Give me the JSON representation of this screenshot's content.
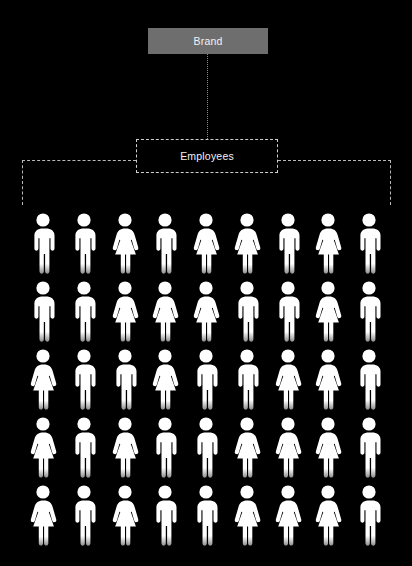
{
  "canvas": {
    "width": 412,
    "height": 566,
    "background_color": "#000000"
  },
  "diagram": {
    "type": "organization-pictogram",
    "nodes": {
      "brand": {
        "label": "Brand",
        "fill_color": "#6e6e6e",
        "text_color": "#f2f2f2",
        "border_style": "none"
      },
      "employees": {
        "label": "Employees",
        "fill_color": "transparent",
        "text_color": "#f2f2f2",
        "border_style": "dashed",
        "border_color": "#cfcfcf"
      }
    },
    "connectors": {
      "brand_to_employees": {
        "style": "dotted",
        "color": "#8a8a8a",
        "orientation": "vertical"
      },
      "employees_bracket": {
        "style": "dashed",
        "color": "#b9b9b9",
        "shape": "horizontal-span-with-end-drops"
      }
    }
  },
  "pictogram": {
    "icon_color": "#ffffff",
    "columns": 9,
    "rows": 5,
    "total_figures": 45,
    "male_count": 22,
    "female_count": 23,
    "legend": {
      "male": "person-male-icon",
      "female": "person-female-icon"
    },
    "grid": [
      [
        "male",
        "male",
        "female",
        "male",
        "female",
        "female",
        "male",
        "female",
        "male"
      ],
      [
        "male",
        "male",
        "female",
        "female",
        "female",
        "male",
        "male",
        "female",
        "male"
      ],
      [
        "female",
        "male",
        "male",
        "female",
        "male",
        "male",
        "female",
        "female",
        "male"
      ],
      [
        "female",
        "male",
        "female",
        "male",
        "male",
        "female",
        "female",
        "female",
        "male"
      ],
      [
        "female",
        "male",
        "female",
        "male",
        "male",
        "female",
        "female",
        "female",
        "male"
      ]
    ]
  }
}
